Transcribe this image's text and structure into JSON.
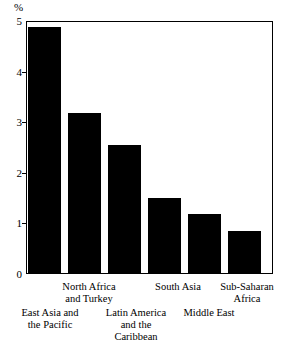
{
  "chart_data": {
    "type": "bar",
    "title": "",
    "xlabel": "",
    "ylabel": "%",
    "ylim": [
      0,
      5
    ],
    "grid": false,
    "legend": "none",
    "yticks": [
      0,
      1,
      2,
      3,
      4,
      5
    ],
    "ytick_labels": [
      "0",
      "1",
      "2",
      "3",
      "4",
      "5"
    ],
    "categories": [
      "East Asia and the Pacific",
      "North Africa and Turkey",
      "Latin America and the Caribbean",
      "South Asia",
      "Middle East",
      "Sub-Saharan Africa"
    ],
    "values": [
      4.9,
      3.2,
      2.55,
      1.5,
      1.2,
      0.85
    ],
    "bar_color": "#000000"
  },
  "axis": {
    "unit_symbol": "%",
    "tick_0": "0",
    "tick_1": "1",
    "tick_2": "2",
    "tick_3": "3",
    "tick_4": "4",
    "tick_5": "5"
  },
  "labels": {
    "east_asia_line1": "East Asia and",
    "east_asia_line2": "the Pacific",
    "north_africa_line1": "North Africa",
    "north_africa_line2": "and Turkey",
    "latin_america_line1": "Latin America",
    "latin_america_line2": "and the",
    "latin_america_line3": "Caribbean",
    "south_asia_line1": "South Asia",
    "middle_east_line1": "Middle East",
    "sub_saharan_line1": "Sub-Saharan",
    "sub_saharan_line2": "Africa"
  }
}
